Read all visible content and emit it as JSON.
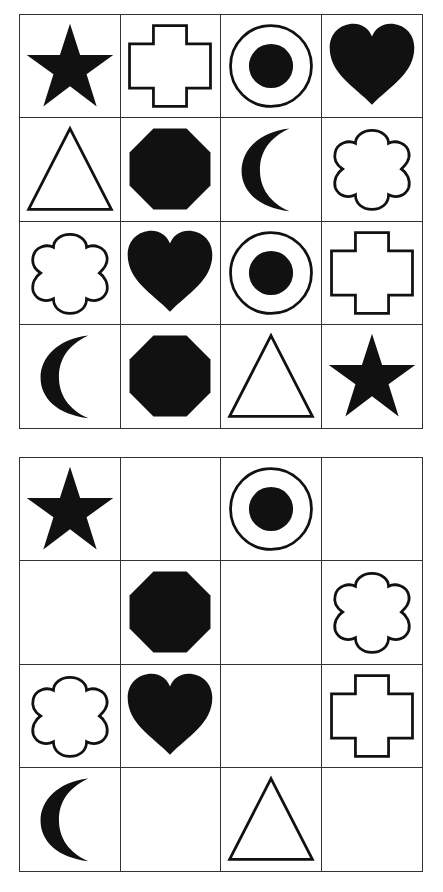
{
  "puzzle": {
    "reference_grid": {
      "rows": 4,
      "cols": 4,
      "cells": [
        "star",
        "cross",
        "target",
        "heart",
        "triangle",
        "octagon",
        "moon",
        "flower",
        "flower",
        "heart",
        "target",
        "cross",
        "moon",
        "octagon",
        "triangle",
        "star"
      ]
    },
    "answer_grid": {
      "rows": 4,
      "cols": 4,
      "cells": [
        "star",
        "empty",
        "target",
        "empty",
        "empty",
        "octagon",
        "empty",
        "flower",
        "flower",
        "heart",
        "empty",
        "cross",
        "moon",
        "empty",
        "triangle",
        "empty"
      ]
    }
  },
  "colors": {
    "ink": "#111111",
    "grid_line": "#333333",
    "background": "#ffffff"
  }
}
